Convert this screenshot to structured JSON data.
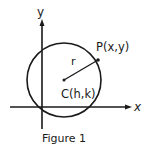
{
  "figure": {
    "caption": "Figure 1",
    "axes": {
      "x_label": "x",
      "y_label": "y"
    },
    "circle": {
      "center_label": "C(h,k)",
      "point_label": "P(x,y)",
      "radius_label": "r"
    },
    "colors": {
      "ink": "#1a1a1a",
      "background": "#ffffff"
    }
  }
}
